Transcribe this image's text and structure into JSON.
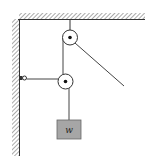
{
  "diagram": {
    "type": "pulley-system",
    "elements": {
      "ceiling": "fixed ceiling (hatched)",
      "wall": "fixed left wall (hatched)",
      "top_pulley": "fixed pulley hung from ceiling",
      "lower_pulley": "movable pulley",
      "wall_anchor": "rope anchor on wall",
      "block": "hanging weight"
    },
    "block_label": "w",
    "colors": {
      "line": "#333333",
      "block_fill": "#a6a6a6",
      "background": "#ffffff"
    }
  }
}
